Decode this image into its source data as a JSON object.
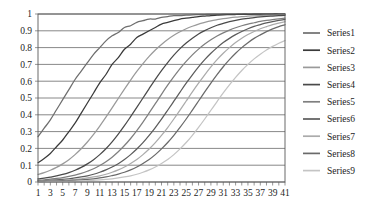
{
  "chart_data": {
    "type": "line",
    "title": "",
    "subtitle": "",
    "xlabel": "",
    "ylabel": "",
    "xlim": [
      1,
      41
    ],
    "ylim": [
      0,
      1
    ],
    "grid": true,
    "grid_axis": "y",
    "legend_position": "right",
    "y_ticks": [
      "1",
      "0.9",
      "0.8",
      "0.7",
      "0.6",
      "0.5",
      "0.4",
      "0.3",
      "0.2",
      "0.1",
      "0"
    ],
    "y_tick_values": [
      1,
      0.9,
      0.8,
      0.7,
      0.6,
      0.5,
      0.4,
      0.3,
      0.2,
      0.1,
      0
    ],
    "x_ticks": [
      "1",
      "3",
      "5",
      "7",
      "9",
      "11",
      "13",
      "15",
      "17",
      "19",
      "21",
      "23",
      "25",
      "27",
      "29",
      "31",
      "33",
      "35",
      "37",
      "39",
      "41"
    ],
    "x_tick_values": [
      1,
      3,
      5,
      7,
      9,
      11,
      13,
      15,
      17,
      19,
      21,
      23,
      25,
      27,
      29,
      31,
      33,
      35,
      37,
      39,
      41
    ],
    "x": [
      1,
      2,
      3,
      4,
      5,
      6,
      7,
      8,
      9,
      10,
      11,
      12,
      13,
      14,
      15,
      16,
      17,
      18,
      19,
      20,
      21,
      22,
      23,
      24,
      25,
      26,
      27,
      28,
      29,
      30,
      31,
      32,
      33,
      34,
      35,
      36,
      37,
      38,
      39,
      40,
      41
    ],
    "series": [
      {
        "name": "Series1",
        "color": "#6e6e6e",
        "values": [
          0.27,
          0.32,
          0.37,
          0.43,
          0.49,
          0.55,
          0.61,
          0.66,
          0.71,
          0.76,
          0.8,
          0.84,
          0.87,
          0.89,
          0.92,
          0.93,
          0.95,
          0.96,
          0.97,
          0.97,
          0.98,
          0.985,
          0.99,
          0.99,
          0.993,
          0.995,
          0.996,
          0.997,
          0.998,
          0.998,
          0.999,
          0.999,
          0.999,
          1.0,
          1.0,
          1.0,
          1.0,
          1.0,
          1.0,
          1.0,
          1.0
        ]
      },
      {
        "name": "Series2",
        "color": "#3a3a3a",
        "values": [
          0.115,
          0.14,
          0.17,
          0.21,
          0.25,
          0.3,
          0.35,
          0.41,
          0.47,
          0.53,
          0.59,
          0.64,
          0.7,
          0.74,
          0.79,
          0.82,
          0.86,
          0.88,
          0.9,
          0.92,
          0.94,
          0.95,
          0.96,
          0.97,
          0.975,
          0.98,
          0.985,
          0.988,
          0.991,
          0.993,
          0.995,
          0.996,
          0.997,
          0.998,
          0.998,
          0.999,
          0.999,
          0.999,
          1.0,
          1.0,
          1.0
        ]
      },
      {
        "name": "Series3",
        "color": "#9a9a9a",
        "values": [
          0.045,
          0.056,
          0.07,
          0.087,
          0.108,
          0.133,
          0.163,
          0.198,
          0.238,
          0.283,
          0.333,
          0.386,
          0.441,
          0.497,
          0.553,
          0.607,
          0.658,
          0.705,
          0.748,
          0.786,
          0.819,
          0.848,
          0.873,
          0.894,
          0.912,
          0.927,
          0.94,
          0.95,
          0.959,
          0.966,
          0.972,
          0.977,
          0.981,
          0.984,
          0.987,
          0.989,
          0.991,
          0.993,
          0.994,
          0.995,
          0.996
        ]
      },
      {
        "name": "Series4",
        "color": "#4a4a4a",
        "values": [
          0.018,
          0.023,
          0.029,
          0.036,
          0.045,
          0.056,
          0.07,
          0.087,
          0.108,
          0.133,
          0.163,
          0.198,
          0.239,
          0.285,
          0.335,
          0.389,
          0.444,
          0.5,
          0.556,
          0.611,
          0.663,
          0.711,
          0.755,
          0.794,
          0.827,
          0.856,
          0.881,
          0.901,
          0.918,
          0.933,
          0.944,
          0.954,
          0.962,
          0.969,
          0.974,
          0.979,
          0.983,
          0.986,
          0.988,
          0.99,
          0.992
        ]
      },
      {
        "name": "Series5",
        "color": "#7f7f7f",
        "values": [
          0.011,
          0.013,
          0.017,
          0.021,
          0.026,
          0.033,
          0.041,
          0.051,
          0.064,
          0.079,
          0.098,
          0.121,
          0.148,
          0.18,
          0.217,
          0.259,
          0.306,
          0.357,
          0.411,
          0.466,
          0.522,
          0.576,
          0.627,
          0.675,
          0.718,
          0.757,
          0.791,
          0.821,
          0.847,
          0.869,
          0.888,
          0.904,
          0.918,
          0.93,
          0.94,
          0.948,
          0.956,
          0.962,
          0.967,
          0.971,
          0.975
        ]
      },
      {
        "name": "Series6",
        "color": "#5c5c5c",
        "values": [
          0.006,
          0.008,
          0.01,
          0.012,
          0.015,
          0.019,
          0.024,
          0.03,
          0.037,
          0.046,
          0.058,
          0.072,
          0.089,
          0.109,
          0.134,
          0.163,
          0.196,
          0.234,
          0.277,
          0.324,
          0.374,
          0.427,
          0.481,
          0.535,
          0.588,
          0.638,
          0.685,
          0.728,
          0.766,
          0.8,
          0.83,
          0.855,
          0.877,
          0.896,
          0.912,
          0.926,
          0.937,
          0.947,
          0.955,
          0.962,
          0.967
        ]
      },
      {
        "name": "Series7",
        "color": "#ababab",
        "values": [
          0.004,
          0.005,
          0.006,
          0.008,
          0.01,
          0.012,
          0.015,
          0.019,
          0.024,
          0.03,
          0.037,
          0.046,
          0.058,
          0.072,
          0.089,
          0.11,
          0.134,
          0.163,
          0.196,
          0.234,
          0.277,
          0.324,
          0.375,
          0.428,
          0.482,
          0.536,
          0.588,
          0.638,
          0.685,
          0.728,
          0.766,
          0.8,
          0.83,
          0.856,
          0.878,
          0.896,
          0.912,
          0.925,
          0.937,
          0.946,
          0.954
        ]
      },
      {
        "name": "Series8",
        "color": "#6a6a6a",
        "values": [
          0.002,
          0.003,
          0.004,
          0.005,
          0.006,
          0.008,
          0.01,
          0.012,
          0.015,
          0.019,
          0.024,
          0.03,
          0.038,
          0.047,
          0.058,
          0.072,
          0.089,
          0.11,
          0.134,
          0.163,
          0.197,
          0.235,
          0.278,
          0.325,
          0.375,
          0.428,
          0.482,
          0.536,
          0.589,
          0.639,
          0.686,
          0.728,
          0.766,
          0.8,
          0.829,
          0.855,
          0.876,
          0.895,
          0.911,
          0.925,
          0.936
        ]
      },
      {
        "name": "Series9",
        "color": "#c4c4c4",
        "values": [
          0.001,
          0.001,
          0.002,
          0.002,
          0.003,
          0.004,
          0.005,
          0.006,
          0.008,
          0.01,
          0.012,
          0.015,
          0.019,
          0.024,
          0.03,
          0.037,
          0.046,
          0.058,
          0.072,
          0.089,
          0.11,
          0.134,
          0.163,
          0.197,
          0.235,
          0.278,
          0.325,
          0.375,
          0.427,
          0.479,
          0.53,
          0.578,
          0.623,
          0.664,
          0.7,
          0.733,
          0.761,
          0.786,
          0.807,
          0.826,
          0.842
        ]
      }
    ]
  },
  "legend": {
    "items": [
      {
        "label": "Series1"
      },
      {
        "label": "Series2"
      },
      {
        "label": "Series3"
      },
      {
        "label": "Series4"
      },
      {
        "label": "Series5"
      },
      {
        "label": "Series6"
      },
      {
        "label": "Series7"
      },
      {
        "label": "Series8"
      },
      {
        "label": "Series9"
      }
    ]
  }
}
